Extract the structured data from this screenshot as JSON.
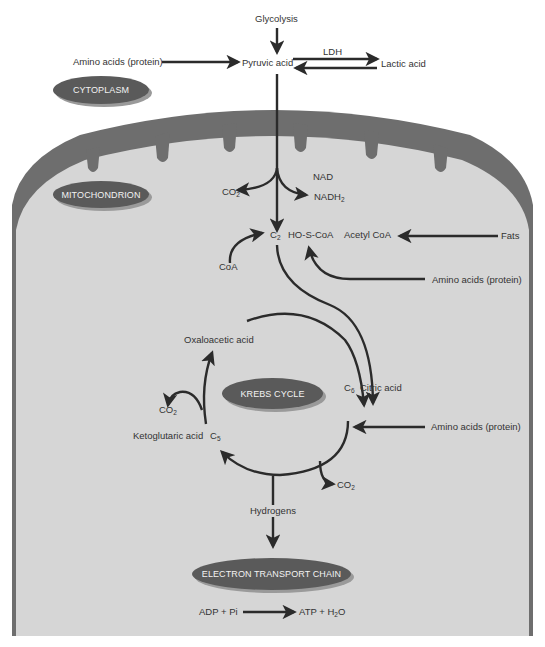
{
  "colors": {
    "background": "#ffffff",
    "membrane": "#6e6e6e",
    "matrix": "#d6d6d6",
    "arrow": "#2b2b2b",
    "label_pill": "#5a5a5a",
    "pill_text": "#f2f2f2"
  },
  "regions": {
    "cytoplasm": "CYTOPLASM",
    "mitochondrion": "MITOCHONDRION",
    "krebs": "KREBS CYCLE",
    "etc": "ELECTRON TRANSPORT CHAIN"
  },
  "cytoplasm_labels": {
    "glycolysis": "Glycolysis",
    "amino_acids": "Amino acids (protein)",
    "pyruvic": "Pyruvic acid",
    "ldh": "LDH",
    "lactic": "Lactic acid"
  },
  "mito_labels": {
    "nad": "NAD",
    "co2_a": "CO",
    "co2_a_sub": "2",
    "nadh": "NADH",
    "nadh_sub": "2",
    "c2": "C",
    "c2_sub": "2",
    "hoscoa": "HO-S-CoA",
    "acetyl": "Acetyl CoA",
    "fats": "Fats",
    "coa": "CoA",
    "amino_acids_2": "Amino acids (protein)",
    "oxaloacetic": "Oxaloacetic acid",
    "c6": "C",
    "c6_sub": "6",
    "citric": "Citric acid",
    "co2_b": "CO",
    "co2_b_sub": "2",
    "ketoglutaric": "Ketoglutaric acid",
    "c5": "C",
    "c5_sub": "5",
    "amino_acids_3": "Amino acids (protein)",
    "co2_c": "CO",
    "co2_c_sub": "2",
    "hydrogens": "Hydrogens",
    "adp": "ADP + Pi",
    "atp": "ATP + H",
    "atp_sub": "2",
    "atp_tail": "O"
  }
}
